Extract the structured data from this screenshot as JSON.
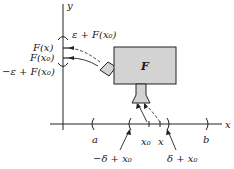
{
  "diagram": {
    "type": "function-mapping",
    "axes": {
      "x_label": "x",
      "y_label": "y"
    },
    "function_box": {
      "label": "F",
      "fill": "#d3d3d3"
    },
    "y_axis_labels": {
      "upper": "ε + F(x₀)",
      "fx": "F(x)",
      "fx0": "F(x₀)",
      "lower": "−ε + F(x₀)"
    },
    "x_axis_labels": {
      "a": "a",
      "x0": "x₀",
      "x": "x",
      "b": "b",
      "left_delta": "−δ + x₀",
      "right_delta": "δ + x₀"
    }
  }
}
